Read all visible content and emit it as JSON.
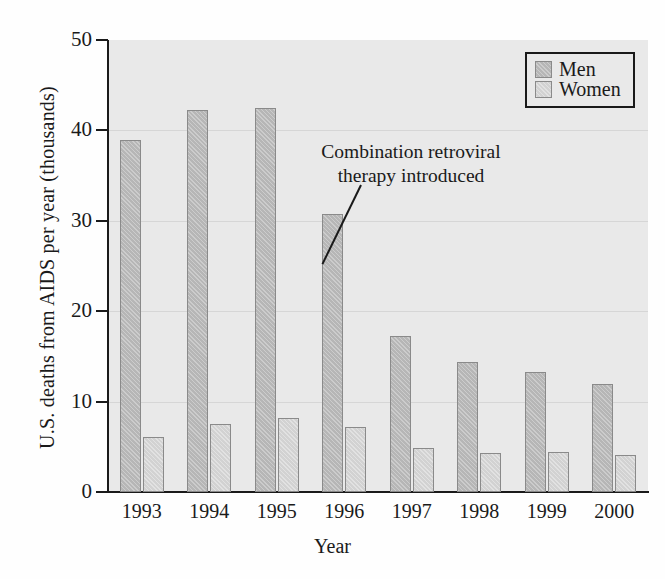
{
  "chart_data": {
    "type": "bar",
    "title": "",
    "xlabel": "Year",
    "ylabel": "U.S. deaths from AIDS per year (thousands)",
    "categories": [
      "1993",
      "1994",
      "1995",
      "1996",
      "1997",
      "1998",
      "1999",
      "2000"
    ],
    "series": [
      {
        "name": "Men",
        "values": [
          38.9,
          42.3,
          42.5,
          30.8,
          17.3,
          14.4,
          13.3,
          11.9
        ]
      },
      {
        "name": "Women",
        "values": [
          6.1,
          7.5,
          8.2,
          7.2,
          4.9,
          4.3,
          4.4,
          4.1
        ]
      }
    ],
    "ylim": [
      0,
      50
    ],
    "yticks": [
      0,
      10,
      20,
      30,
      40,
      50
    ],
    "ytick_labels": [
      "0",
      "10",
      "20",
      "30",
      "40",
      "50"
    ],
    "grid": true,
    "grid_axis": "y",
    "legend_position": "top-right",
    "annotations": [
      {
        "text_line1": "Combination retroviral",
        "text_line2": "therapy introduced",
        "leader_line": true
      }
    ],
    "colors": {
      "men": "#b6b6b6",
      "women": "#d2d2d2",
      "plot_background": "#e9e9e9",
      "gridline": "#d6d6d6",
      "axis": "#1a1a1a",
      "bar_border": "#8a8a8a"
    }
  },
  "legend": {
    "items": [
      {
        "label": "Men"
      },
      {
        "label": "Women"
      }
    ]
  },
  "annotation": {
    "line1": "Combination retroviral",
    "line2": "therapy introduced"
  },
  "axes": {
    "x_title": "Year",
    "y_title": "U.S. deaths from AIDS per year (thousands)"
  }
}
